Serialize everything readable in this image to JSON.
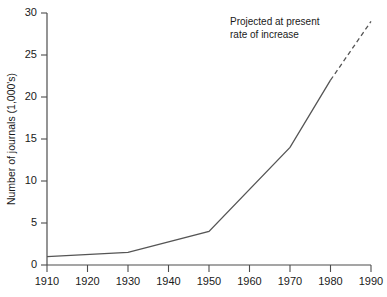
{
  "chart_data": {
    "type": "line",
    "title": "",
    "xlabel": "",
    "ylabel": "Number of journals (1,000's)",
    "xlim": [
      1910,
      1990
    ],
    "ylim": [
      0,
      30
    ],
    "grid": false,
    "legend_position": "none",
    "x_tick_labels": [
      "1910",
      "1920",
      "1930",
      "1940",
      "1950",
      "1960",
      "1970",
      "1980",
      "1990"
    ],
    "x_ticks": [
      1910,
      1920,
      1930,
      1940,
      1950,
      1960,
      1970,
      1980,
      1990
    ],
    "y_tick_labels": [
      "0",
      "5",
      "10",
      "15",
      "20",
      "25",
      "30"
    ],
    "y_ticks": [
      0,
      5,
      10,
      15,
      20,
      25,
      30
    ],
    "series": [
      {
        "name": "Number of journals (observed)",
        "style": "solid",
        "x": [
          1910,
          1930,
          1950,
          1970,
          1980
        ],
        "values": [
          1.0,
          1.5,
          4.0,
          14.0,
          22.0
        ]
      },
      {
        "name": "Projected at present rate of increase",
        "style": "dashed",
        "x": [
          1980,
          1990
        ],
        "values": [
          22.0,
          29.0
        ]
      }
    ],
    "annotations": [
      {
        "name": "projection-note",
        "line1": "Projected at present",
        "line2": "rate of increase",
        "x": 1967,
        "y": 28.5
      }
    ],
    "colors": {
      "background": "#ffffff",
      "axis": "#4d4d4d",
      "series": "#555555",
      "text": "#1a1a1a"
    }
  }
}
